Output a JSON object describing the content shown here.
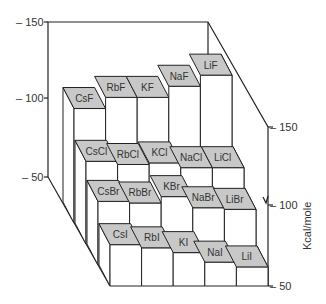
{
  "chart_data": {
    "type": "bar3d",
    "title": "",
    "ylabel": "Kcal/mole",
    "ylim": [
      50,
      150
    ],
    "left_axis_ticks": [
      "150",
      "100",
      "50"
    ],
    "right_axis_ticks": [
      "150",
      "100",
      "50"
    ],
    "categories": [
      "Cs",
      "Rb",
      "K",
      "Na",
      "Li"
    ],
    "rows": [
      "F",
      "Cl",
      "Br",
      "I"
    ],
    "series": [
      {
        "name": "F",
        "labels": [
          "CsF",
          "RbF",
          "KF",
          "NaF",
          "LiF"
        ],
        "values": [
          122,
          129,
          129,
          136,
          143
        ]
      },
      {
        "name": "Cl",
        "labels": [
          "CsCl",
          "RbCl",
          "KCl",
          "NaCl",
          "LiCl"
        ],
        "values": [
          102,
          100,
          101,
          98,
          98
        ]
      },
      {
        "name": "Br",
        "labels": [
          "CsBr",
          "RbBr",
          "KBr",
          "NaBr",
          "LiBr"
        ],
        "values": [
          90,
          89,
          93,
          86,
          85
        ]
      },
      {
        "name": "I",
        "labels": [
          "CsI",
          "RbI",
          "KI",
          "NaI",
          "LiI"
        ],
        "values": [
          76,
          74,
          71,
          65,
          62
        ]
      }
    ],
    "grid": false,
    "legend": "none"
  },
  "axes": {
    "left": {
      "t150": "– 150",
      "t100": "– 100",
      "t50": "– 50"
    },
    "right": {
      "t150": "– 150",
      "t100": "– 100",
      "t50": "– 50"
    },
    "unit_label": "Kcal/mole"
  },
  "colors": {
    "top_face": "#c8c8c8",
    "front_face": "#ffffff",
    "stroke": "#222222"
  }
}
